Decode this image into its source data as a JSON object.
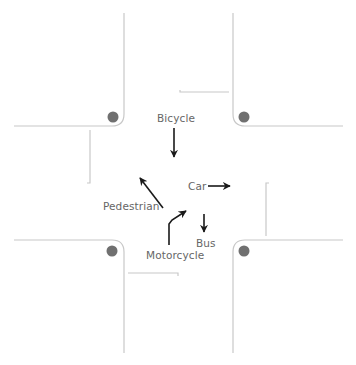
{
  "diagram": {
    "type": "intersection",
    "colors": {
      "road_edge": "#c8c8c8",
      "lane_line": "#c8c8c8",
      "signal_dot": "#707070",
      "arrow": "#1a1a1a",
      "label": "#666666"
    },
    "labels": {
      "bicycle": "Bicycle",
      "car": "Car",
      "pedestrian": "Pedestrian",
      "bus": "Bus",
      "motorcycle": "Motorcycle"
    },
    "icons": {
      "signal": "signal-dot-icon",
      "arrow": "arrow-icon"
    }
  }
}
